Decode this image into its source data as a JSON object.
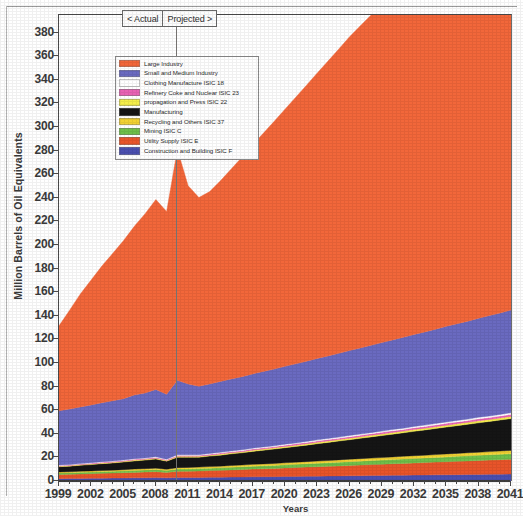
{
  "chart_data": {
    "type": "area",
    "stacked": true,
    "title": "",
    "xlabel": "Years",
    "ylabel": "Million Barrels of Oil Equivalents",
    "xlim": [
      1999,
      2041
    ],
    "ylim": [
      0,
      395
    ],
    "ytick_step": 20,
    "xtick_step": 3,
    "grid": false,
    "legend_position": "upper-left-inside",
    "yticks": [
      0,
      20,
      40,
      60,
      80,
      100,
      120,
      140,
      160,
      180,
      200,
      220,
      240,
      260,
      280,
      300,
      320,
      340,
      360,
      380
    ],
    "xticks": [
      1999,
      2002,
      2005,
      2008,
      2011,
      2014,
      2017,
      2020,
      2023,
      2026,
      2029,
      2032,
      2035,
      2038,
      2041
    ],
    "x": [
      1999,
      2000,
      2001,
      2002,
      2003,
      2004,
      2005,
      2006,
      2007,
      2008,
      2009,
      2010,
      2011,
      2012,
      2013,
      2014,
      2015,
      2016,
      2017,
      2018,
      2019,
      2020,
      2021,
      2022,
      2023,
      2024,
      2025,
      2026,
      2027,
      2028,
      2029,
      2030,
      2031,
      2032,
      2033,
      2034,
      2035,
      2036,
      2037,
      2038,
      2039,
      2040,
      2041
    ],
    "series": [
      {
        "name": "Construction and Building ISIC F",
        "color": "#4a4fb0",
        "values": [
          2.0,
          2.1,
          2.2,
          2.3,
          2.4,
          2.5,
          2.6,
          2.7,
          2.8,
          2.9,
          2.7,
          3.0,
          3.0,
          3.0,
          3.1,
          3.2,
          3.3,
          3.4,
          3.5,
          3.6,
          3.7,
          3.8,
          3.9,
          4.0,
          4.1,
          4.2,
          4.3,
          4.4,
          4.5,
          4.6,
          4.7,
          4.8,
          4.9,
          5.0,
          5.1,
          5.2,
          5.3,
          5.4,
          5.5,
          5.6,
          5.7,
          5.8,
          5.9
        ]
      },
      {
        "name": "Utility Supply ISIC E",
        "color": "#e8542a",
        "values": [
          3.5,
          3.6,
          3.8,
          3.9,
          4.1,
          4.2,
          4.4,
          4.6,
          4.8,
          5.0,
          4.6,
          5.2,
          5.3,
          5.5,
          5.7,
          5.9,
          6.1,
          6.3,
          6.6,
          6.8,
          7.0,
          7.3,
          7.5,
          7.8,
          8.0,
          8.3,
          8.5,
          8.8,
          9.0,
          9.3,
          9.5,
          9.8,
          10.0,
          10.3,
          10.5,
          10.8,
          11.0,
          11.3,
          11.5,
          11.8,
          12.0,
          12.3,
          12.5
        ]
      },
      {
        "name": "Mining  ISIC C",
        "color": "#6fbf4a",
        "values": [
          1.3,
          1.3,
          1.4,
          1.4,
          1.5,
          1.5,
          1.6,
          1.7,
          1.7,
          1.8,
          1.6,
          1.9,
          1.9,
          2.0,
          2.1,
          2.1,
          2.2,
          2.3,
          2.4,
          2.5,
          2.5,
          2.6,
          2.7,
          2.8,
          2.9,
          3.0,
          3.1,
          3.2,
          3.3,
          3.4,
          3.5,
          3.6,
          3.7,
          3.8,
          3.9,
          4.0,
          4.1,
          4.2,
          4.3,
          4.4,
          4.5,
          4.6,
          4.7
        ]
      },
      {
        "name": "Recycling and Others ISIC 37",
        "color": "#f2d233",
        "values": [
          0.8,
          0.8,
          0.9,
          0.9,
          0.9,
          1.0,
          1.0,
          1.1,
          1.1,
          1.2,
          1.0,
          1.2,
          1.3,
          1.3,
          1.4,
          1.4,
          1.5,
          1.5,
          1.6,
          1.6,
          1.7,
          1.7,
          1.8,
          1.8,
          1.9,
          1.9,
          2.0,
          2.0,
          2.1,
          2.1,
          2.2,
          2.2,
          2.3,
          2.3,
          2.4,
          2.4,
          2.5,
          2.5,
          2.6,
          2.6,
          2.7,
          2.7,
          2.8
        ]
      },
      {
        "name": "Manufacturing",
        "color": "#151515",
        "values": [
          4.5,
          4.8,
          5.1,
          5.4,
          5.8,
          6.1,
          6.5,
          6.9,
          7.3,
          7.7,
          6.9,
          8.8,
          8.6,
          8.3,
          8.8,
          9.3,
          9.9,
          10.4,
          11.0,
          11.6,
          12.2,
          12.8,
          13.4,
          14.0,
          14.7,
          15.3,
          16.0,
          16.6,
          17.3,
          18.0,
          18.6,
          19.3,
          20.0,
          20.7,
          21.4,
          22.1,
          22.8,
          23.5,
          24.2,
          24.9,
          25.6,
          26.3,
          27.0
        ]
      },
      {
        "name": "propagation and Press ISIC 22",
        "color": "#f5ee4a",
        "values": [
          0.5,
          0.5,
          0.5,
          0.6,
          0.6,
          0.6,
          0.6,
          0.7,
          0.7,
          0.7,
          0.6,
          0.8,
          0.8,
          0.8,
          0.8,
          0.9,
          0.9,
          0.9,
          1.0,
          1.0,
          1.0,
          1.1,
          1.1,
          1.1,
          1.2,
          1.2,
          1.2,
          1.3,
          1.3,
          1.3,
          1.4,
          1.4,
          1.4,
          1.5,
          1.5,
          1.5,
          1.6,
          1.6,
          1.6,
          1.7,
          1.7,
          1.7,
          1.8
        ]
      },
      {
        "name": "Refinery Coke and Nuclear ISIC 23",
        "color": "#e862b4",
        "values": [
          0.5,
          0.5,
          0.5,
          0.6,
          0.6,
          0.6,
          0.6,
          0.7,
          0.7,
          0.7,
          0.6,
          0.8,
          0.8,
          0.8,
          0.8,
          0.9,
          0.9,
          0.9,
          1.0,
          1.0,
          1.0,
          1.1,
          1.1,
          1.1,
          1.2,
          1.2,
          1.2,
          1.3,
          1.3,
          1.3,
          1.4,
          1.4,
          1.4,
          1.5,
          1.5,
          1.5,
          1.6,
          1.6,
          1.6,
          1.7,
          1.7,
          1.7,
          1.8
        ]
      },
      {
        "name": "Clothing Manufacture ISIC 18",
        "color": "#ffffff",
        "values": [
          0.4,
          0.4,
          0.4,
          0.4,
          0.5,
          0.5,
          0.5,
          0.5,
          0.5,
          0.6,
          0.5,
          0.6,
          0.6,
          0.6,
          0.6,
          0.7,
          0.7,
          0.7,
          0.7,
          0.8,
          0.8,
          0.8,
          0.8,
          0.9,
          0.9,
          0.9,
          0.9,
          1.0,
          1.0,
          1.0,
          1.0,
          1.1,
          1.1,
          1.1,
          1.1,
          1.2,
          1.2,
          1.2,
          1.2,
          1.3,
          1.3,
          1.3,
          1.4
        ]
      },
      {
        "name": "Small and Medium Industry",
        "color": "#6a6ac0",
        "values": [
          46,
          47,
          48,
          49,
          50,
          51,
          52,
          54,
          55,
          57,
          55,
          63,
          60,
          58,
          59,
          60,
          61,
          62,
          63,
          64,
          65,
          66,
          67,
          68,
          69,
          70,
          71,
          72,
          73,
          74,
          75,
          76,
          77,
          78,
          79,
          80,
          81,
          82,
          83,
          84,
          85,
          86,
          87
        ]
      },
      {
        "name": "Large Industry",
        "color": "#f2673a",
        "values": [
          72,
          84,
          96,
          106,
          116,
          125,
          134,
          143,
          152,
          161,
          155,
          196,
          168,
          160,
          163,
          170,
          178,
          186,
          194,
          202,
          210,
          218,
          226,
          234,
          242,
          250,
          258,
          266,
          273,
          280,
          287,
          293,
          299,
          304,
          308,
          311,
          314,
          316,
          318,
          319,
          320,
          320,
          320
        ]
      }
    ],
    "annotations": {
      "left_label": "< Actual",
      "right_label": "Projected >",
      "divider_year": 2010
    },
    "legend_entries": [
      {
        "label": "Large Industry",
        "color": "#f2673a"
      },
      {
        "label": "Small and Medium Industry",
        "color": "#6a6ac0"
      },
      {
        "label": "Clothing Manufacture ISIC 18",
        "color": "#ffffff"
      },
      {
        "label": "Refinery Coke and Nuclear ISIC 23",
        "color": "#e862b4"
      },
      {
        "label": "propagation and Press ISIC 22",
        "color": "#f5ee4a"
      },
      {
        "label": "Manufacturing",
        "color": "#151515"
      },
      {
        "label": "Recycling and Others ISIC 37",
        "color": "#f2d233"
      },
      {
        "label": "Mining  ISIC C",
        "color": "#6fbf4a"
      },
      {
        "label": "Utility Supply ISIC E",
        "color": "#e8542a"
      },
      {
        "label": "Construction and Building ISIC F",
        "color": "#4a4fb0"
      }
    ]
  }
}
